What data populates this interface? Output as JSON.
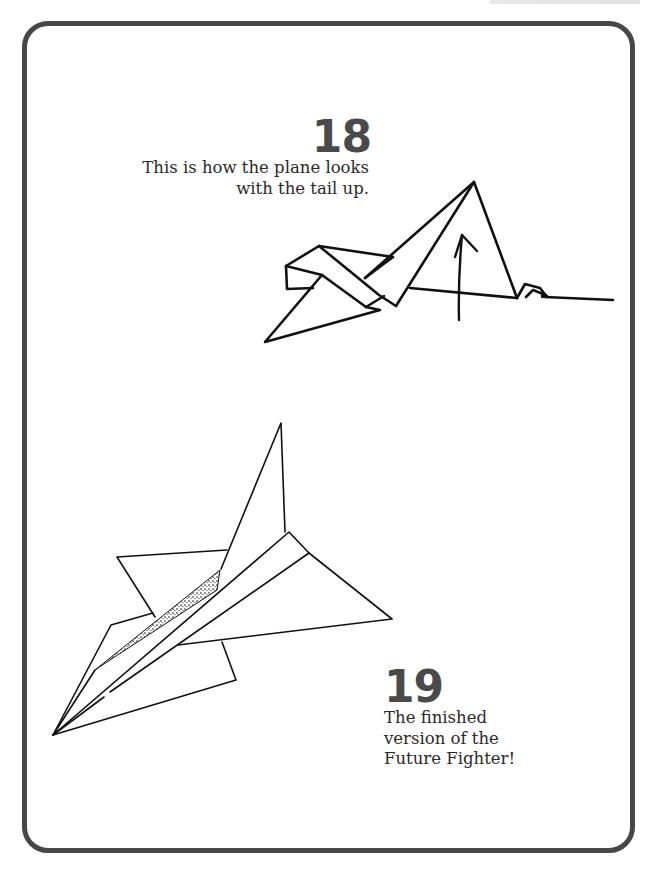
{
  "page": {
    "steps": [
      {
        "number": "18",
        "caption_lines": [
          "This is how the plane looks",
          "with the tail up."
        ],
        "illustration": "plane-with-tail-up-diagram"
      },
      {
        "number": "19",
        "caption_lines": [
          "The finished",
          "version of the",
          "Future Fighter!"
        ],
        "illustration": "finished-future-fighter-diagram"
      }
    ]
  },
  "colors": {
    "frame_border": "#474747",
    "step_number": "#4a4a4a",
    "text": "#2a2a2a",
    "line_art": "#111111",
    "background": "#ffffff"
  }
}
